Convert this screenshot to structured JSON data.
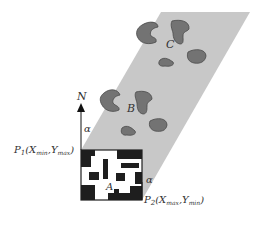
{
  "diagram": {
    "labels": {
      "north": "N",
      "alpha_top": "α",
      "alpha_bottom": "α",
      "p1_main": "P",
      "p1_sub": "1",
      "p1_coords": "(X",
      "p1_xsub": "min",
      "p1_sep": ",Y",
      "p1_ysub": "max",
      "p1_close": ")",
      "p2_main": "P",
      "p2_sub": "2",
      "p2_coords": "(X",
      "p2_xsub": "max",
      "p2_sep": ",Y",
      "p2_ysub": "min",
      "p2_close": ")",
      "region_a": "A",
      "region_b": "B",
      "region_c": "C"
    },
    "colors": {
      "strip_fill": "#c8c8c8",
      "blob_fill": "#737373",
      "blob_stroke": "#4a4a4a",
      "grid_dark": "#1e1e1e",
      "text": "#333333"
    }
  }
}
